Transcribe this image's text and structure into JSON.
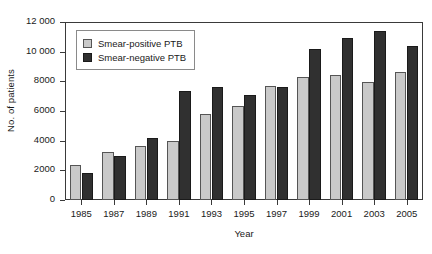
{
  "chart_data": {
    "type": "bar",
    "title": "",
    "xlabel": "Year",
    "ylabel": "No. of patients",
    "categories": [
      "1985",
      "1987",
      "1989",
      "1991",
      "1993",
      "1995",
      "1997",
      "1999",
      "2001",
      "2003",
      "2005"
    ],
    "series": [
      {
        "name": "Smear-positive PTB",
        "color": "#c9c9c9",
        "values": [
          2350,
          3250,
          3650,
          4000,
          5800,
          6350,
          7700,
          8300,
          8450,
          7950,
          8650
        ]
      },
      {
        "name": "Smear-negative PTB",
        "color": "#303030",
        "values": [
          1850,
          2950,
          4200,
          7350,
          7600,
          7050,
          7600,
          10150,
          10900,
          11400,
          10350
        ]
      }
    ],
    "ylim": [
      0,
      12000
    ],
    "yticks": [
      0,
      2000,
      4000,
      6000,
      8000,
      10000,
      12000
    ],
    "ytick_labels": [
      "0",
      "2000",
      "4000",
      "6000",
      "8000",
      "10 000",
      "12 000"
    ],
    "grid": false,
    "legend_position": "top-left"
  },
  "legend": {
    "entries": [
      {
        "label": "Smear-positive PTB",
        "swatch": "series-pos"
      },
      {
        "label": "Smear-negative PTB",
        "swatch": "series-neg"
      }
    ]
  }
}
